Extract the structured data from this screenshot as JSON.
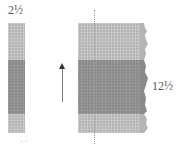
{
  "diagram": {
    "left_label": "2½",
    "right_label": "12½",
    "bottom_marks": "· ·",
    "colors": {
      "light_section": "#b4b4b4",
      "dark_section": "#8a8a8a",
      "arrow": "#333333",
      "text": "#555555"
    },
    "left_bar": {
      "sections": [
        "light",
        "dark",
        "light"
      ]
    },
    "right_block": {
      "sections": [
        "light",
        "dark",
        "light"
      ],
      "right_edge": "torn/irregular"
    },
    "arrow_direction": "up"
  }
}
